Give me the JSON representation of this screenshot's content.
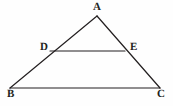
{
  "figure": {
    "type": "geometry-diagram",
    "shape": "triangle-with-midsegment",
    "background_color": "#fefefe",
    "stroke_color": "#231f20",
    "stroke_width": 1.2,
    "canvas": {
      "width": 173,
      "height": 106
    },
    "points": {
      "A": {
        "label": "A",
        "x": 97,
        "y": 16
      },
      "B": {
        "label": "B",
        "x": 10,
        "y": 88
      },
      "C": {
        "label": "C",
        "x": 160,
        "y": 88
      },
      "D": {
        "label": "D",
        "x": 50,
        "y": 51
      },
      "E": {
        "label": "E",
        "x": 125,
        "y": 51
      }
    },
    "segments": [
      {
        "name": "AB",
        "from": "A",
        "to": "B",
        "path": "M 97 16 L 10 88"
      },
      {
        "name": "AC",
        "from": "A",
        "to": "C",
        "path": "M 97 16 L 160 88"
      },
      {
        "name": "BC",
        "from": "B",
        "to": "C",
        "path": "M 10 88 L 160 88"
      },
      {
        "name": "DE",
        "from": "D",
        "to": "E",
        "path": "M 50 51 L 125 51"
      }
    ]
  }
}
